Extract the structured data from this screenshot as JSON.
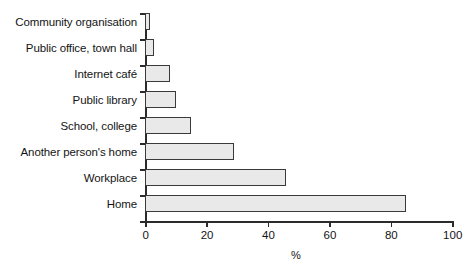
{
  "chart_data": {
    "type": "bar",
    "orientation": "horizontal",
    "title": "",
    "subtitle": "",
    "xlabel": "%",
    "ylabel": "",
    "xlim": [
      0,
      100
    ],
    "xticks": [
      "0",
      "20",
      "40",
      "60",
      "80",
      "100"
    ],
    "grid": false,
    "legend": false,
    "categories": [
      "Community organisation",
      "Public office, town hall",
      "Internet café",
      "Public library",
      "School, college",
      "Another person's home",
      "Workplace",
      "Home"
    ],
    "values": [
      1.5,
      3,
      8,
      10,
      15,
      29,
      46,
      85
    ],
    "series": [
      {
        "name": "Location of internet access",
        "values": [
          1.5,
          3,
          8,
          10,
          15,
          29,
          46,
          85
        ]
      }
    ],
    "bar_fill_color": "#e9e9e9",
    "bar_border_color": "#3a3a3a",
    "axis_color": "#2b2b2b",
    "background_color": "#ffffff"
  }
}
